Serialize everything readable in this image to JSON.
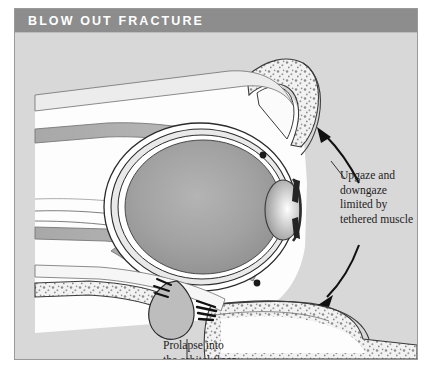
{
  "figure": {
    "header": {
      "title": "BLOW OUT FRACTURE",
      "bar_color": "#8d8d8d",
      "title_color": "#ffffff"
    },
    "panel": {
      "background_color": "#d8d8d8",
      "border_color": "#9a9a9a"
    },
    "annotations": {
      "upgaze": "Upgaze and\ndowngaze\nlimited by\ntethered muscle",
      "prolapse": "Prolapse into\nthe orbital floor\nfracture"
    },
    "footer_note": "",
    "anatomy": {
      "globe_label": "globe",
      "cornea_label": "cornea",
      "superior_rectus_label": "superior rectus muscle",
      "inferior_rectus_label": "inferior rectus muscle",
      "orbital_roof_label": "orbital roof bone",
      "orbital_floor_label": "orbital floor bone",
      "prolapse_label": "prolapsed orbital tissue",
      "fracture_label": "orbital floor fracture",
      "upgaze_arrow_label": "upgaze arrow",
      "downgaze_arrow_label": "downgaze arrow"
    },
    "colors": {
      "bone_fill": "#f4f4f4",
      "bone_stipple": "#8c8c8c",
      "muscle_fill": "#b3b3b3",
      "globe_fill": "#9d9d9d",
      "sclera_fill": "#ffffff",
      "outline": "#2b2b2b",
      "arrow": "#111111"
    }
  }
}
